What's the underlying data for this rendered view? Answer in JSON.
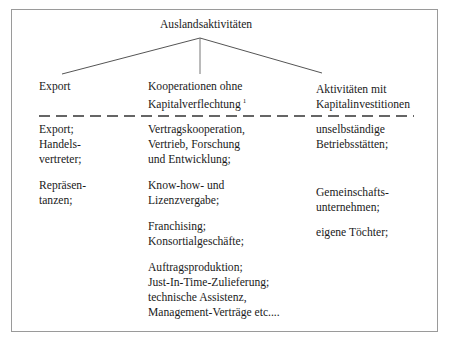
{
  "root": {
    "label": "Auslandsaktivitäten"
  },
  "branches": [
    {
      "label_lines": [
        "Export"
      ]
    },
    {
      "label_lines": [
        "Kooperationen ohne",
        "Kapitalverflechtung"
      ],
      "footnote_marker": "1"
    },
    {
      "label_lines": [
        "Aktivitäten mit",
        "Kapitalinvestitionen"
      ]
    }
  ],
  "columns": [
    {
      "groups": [
        [
          "Export;",
          "Handels-",
          "vertreter;"
        ],
        [
          "Repräsen-",
          "tanzen;"
        ]
      ]
    },
    {
      "groups": [
        [
          "Vertragskooperation,",
          "Vertrieb, Forschung",
          "und Entwicklung;"
        ],
        [
          "Know-how- und",
          "Lizenzvergabe;"
        ],
        [
          "Franchising;",
          "Konsortialgeschäfte;"
        ],
        [
          "Auftragsproduktion;",
          "Just-In-Time-Zulieferung;",
          "technische Assistenz,",
          "Management-Verträge etc...."
        ]
      ]
    },
    {
      "groups": [
        [
          "unselbständige",
          "Betriebsstätten;"
        ],
        [
          "Gemeinschafts-",
          "unternehmen;"
        ],
        [
          "eigene Töchter;"
        ]
      ]
    }
  ],
  "colors": {
    "line": "#555555",
    "border": "#9a9a9a",
    "text": "#1a1a1a"
  }
}
